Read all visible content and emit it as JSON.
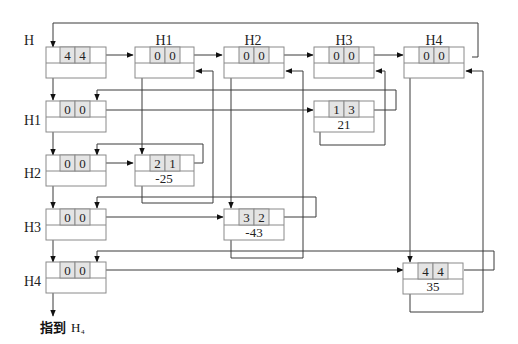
{
  "diagram": {
    "head_label": "H",
    "column_headers": [
      {
        "label": "H1",
        "row": "0",
        "col": "0"
      },
      {
        "label": "H2",
        "row": "0",
        "col": "0"
      },
      {
        "label": "H3",
        "row": "0",
        "col": "0"
      },
      {
        "label": "H4",
        "row": "0",
        "col": "0"
      }
    ],
    "row_headers": [
      {
        "label": "H1",
        "row": "0",
        "col": "0"
      },
      {
        "label": "H2",
        "row": "0",
        "col": "0"
      },
      {
        "label": "H3",
        "row": "0",
        "col": "0"
      },
      {
        "label": "H4",
        "row": "0",
        "col": "0"
      }
    ],
    "head_node": {
      "row": "4",
      "col": "4"
    },
    "elements": [
      {
        "row": "1",
        "col": "3",
        "value": "21"
      },
      {
        "row": "2",
        "col": "1",
        "value": "-25"
      },
      {
        "row": "3",
        "col": "2",
        "value": "-43"
      },
      {
        "row": "4",
        "col": "4",
        "value": "35"
      }
    ],
    "footer": {
      "text": "指到",
      "target": "H",
      "target_subscript": "4"
    },
    "colors": {
      "line": "#3a3a3a",
      "box_border": "#8a8a8a",
      "cell_fill": "#e4e4e4",
      "arrow": "#111111"
    }
  }
}
